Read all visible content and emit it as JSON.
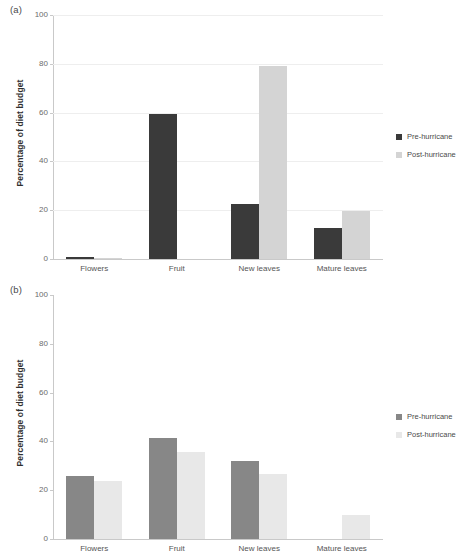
{
  "figure": {
    "panels": [
      {
        "letter": "(a)",
        "ylabel": "Percentage of diet budget",
        "legend": [
          {
            "label": "Pre-hurricane",
            "color": "#3a3a3a",
            "icon": "legend-square-icon"
          },
          {
            "label": "Post-hurricane",
            "color": "#d4d4d4",
            "icon": "legend-square-icon"
          }
        ]
      },
      {
        "letter": "(b)",
        "ylabel": "Percentage of diet budget",
        "legend": [
          {
            "label": "Pre-hurricane",
            "color": "#878787",
            "icon": "legend-square-icon"
          },
          {
            "label": "Post-hurricane",
            "color": "#e8e8e8",
            "icon": "legend-square-icon"
          }
        ]
      }
    ]
  },
  "chart_data": [
    {
      "type": "bar",
      "panel": "(a)",
      "title": "",
      "xlabel": "",
      "ylabel": "Percentage of diet budget",
      "categories": [
        "Flowers",
        "Fruit",
        "New leaves",
        "Mature leaves"
      ],
      "series": [
        {
          "name": "Pre-hurricane",
          "color": "#3a3a3a",
          "values": [
            1.0,
            59.5,
            22.5,
            12.7
          ]
        },
        {
          "name": "Post-hurricane",
          "color": "#d4d4d4",
          "values": [
            0.2,
            0.0,
            79.2,
            19.5
          ]
        }
      ],
      "ylim": [
        0,
        100
      ],
      "yticks": [
        0,
        20,
        40,
        60,
        80,
        100
      ],
      "grid": true,
      "legend_position": "right"
    },
    {
      "type": "bar",
      "panel": "(b)",
      "title": "",
      "xlabel": "",
      "ylabel": "Percentage of diet budget",
      "categories": [
        "Flowers",
        "Fruit",
        "New leaves",
        "Mature leaves"
      ],
      "series": [
        {
          "name": "Pre-hurricane",
          "color": "#878787",
          "values": [
            25.8,
            41.5,
            31.8,
            0.0
          ]
        },
        {
          "name": "Post-hurricane",
          "color": "#e8e8e8",
          "values": [
            23.8,
            35.5,
            26.8,
            10.0
          ]
        }
      ],
      "ylim": [
        0,
        100
      ],
      "yticks": [
        0,
        20,
        40,
        60,
        80,
        100
      ],
      "grid": false,
      "legend_position": "right"
    }
  ]
}
